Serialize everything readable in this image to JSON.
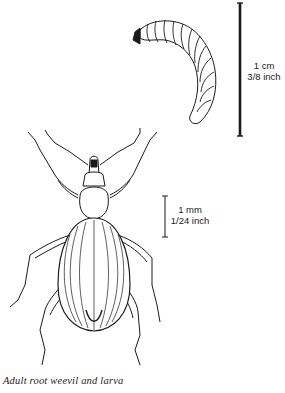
{
  "figure": {
    "caption": "Adult root weevil and larva",
    "subjects": [
      "larva",
      "adult root weevil"
    ],
    "scale_bars": [
      {
        "id": "larva-scale",
        "line1": "1 cm",
        "line2": "3/8 inch"
      },
      {
        "id": "adult-scale",
        "line1": "1 mm",
        "line2": "1/24 inch"
      }
    ],
    "colors": {
      "ink": "#1a1a1a",
      "background": "#ffffff"
    }
  }
}
